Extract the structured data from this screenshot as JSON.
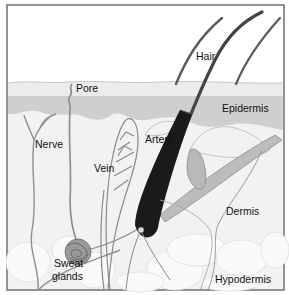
{
  "diagram": {
    "type": "anatomical-cross-section",
    "labels": {
      "hair": "Hair",
      "pore": "Pore",
      "epidermis": "Epidermis",
      "nerve": "Nerve",
      "artery": "Artery",
      "vein": "Vein",
      "dermis": "Dermis",
      "sweat_glands_line1": "Sweat",
      "sweat_glands_line2": "glands",
      "hypodermis": "Hypodermis"
    },
    "colors": {
      "background": "#ffffff",
      "frame": "#6f6f6f",
      "surface": "#ececec",
      "epidermis_band": "#cfcfcf",
      "dermis": "#f1f1f1",
      "hypodermis_fat": "#f9f9f9",
      "structure_line": "#8a8a8a",
      "hair_shaft": "#4a4a4a",
      "follicle": "#111111",
      "gland": "#7a7a7a"
    }
  }
}
